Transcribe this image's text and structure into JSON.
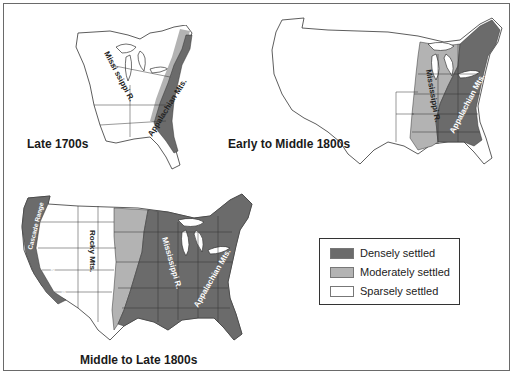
{
  "colors": {
    "dense": "#6b6b6b",
    "moderate": "#b3b3b3",
    "sparse": "#ffffff",
    "outline": "#333333",
    "frame": "#6a6a6a"
  },
  "maps": [
    {
      "id": "late-1700s",
      "caption": "Late 1700s",
      "labels": {
        "river": "Missi ssippi R.",
        "mountains": "Appalachian Mts."
      }
    },
    {
      "id": "early-mid-1800s",
      "caption": "Early to Middle 1800s",
      "labels": {
        "river": "Mississippi R.",
        "mountains": "Appalachian Mts."
      }
    },
    {
      "id": "mid-late-1800s",
      "caption": "Middle to Late 1800s",
      "labels": {
        "cascade": "Cascade Range",
        "sierra": "Sierra Nevada",
        "rocky": "Rocky Mts.",
        "river": "Mississippi R.",
        "mountains": "Appalachian Mts."
      }
    }
  ],
  "legend": {
    "items": [
      {
        "label": "Densely settled",
        "color": "#6b6b6b"
      },
      {
        "label": "Moderately settled",
        "color": "#b3b3b3"
      },
      {
        "label": "Sparsely settled",
        "color": "#ffffff"
      }
    ]
  }
}
